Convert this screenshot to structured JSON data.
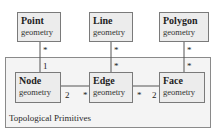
{
  "package": {
    "label": "Topological Primitives"
  },
  "classes": {
    "point": {
      "name": "Point",
      "attr": "geometry"
    },
    "line": {
      "name": "Line",
      "attr": "geometry"
    },
    "polygon": {
      "name": "Polygon",
      "attr": "geometry"
    },
    "node": {
      "name": "Node",
      "attr": "geometry"
    },
    "edge": {
      "name": "Edge",
      "attr": "geometry"
    },
    "face": {
      "name": "Face",
      "attr": "geometry"
    }
  },
  "multiplicities": {
    "point_top": "*",
    "point_node": "1",
    "line_top": "*",
    "line_edge": "*",
    "polygon_top": "*",
    "polygon_face": "*",
    "node_side": "2",
    "edge_left": "*",
    "edge_right": "*",
    "face_side": "2"
  },
  "colors": {
    "box_fill": "#ececec",
    "package_fill": "#f4f4f4",
    "border": "#7a7a7a"
  }
}
